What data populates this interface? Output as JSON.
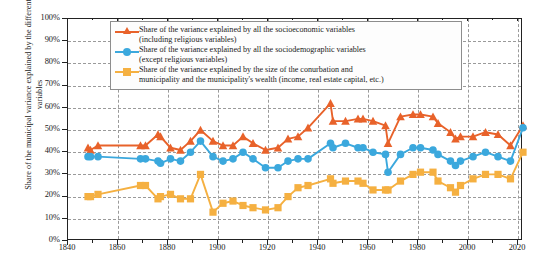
{
  "axes": {
    "ylabel": "Share of the municipal variance explained by the different variables",
    "xlabel": "",
    "yticks": [
      "0%",
      "10%",
      "20%",
      "30%",
      "40%",
      "50%",
      "60%",
      "70%",
      "80%",
      "90%",
      "100%"
    ],
    "xticks": [
      "1840",
      "1860",
      "1880",
      "1900",
      "1920",
      "1940",
      "1960",
      "1980",
      "2000",
      "2020"
    ]
  },
  "legend": {
    "items": [
      {
        "marker": "triangle-marker",
        "color": "#e8622a",
        "line1": "Share of the variance explained by all the socioeconomic variables",
        "line2": "(including religious variables)"
      },
      {
        "marker": "circle-marker",
        "color": "#3ba8dd",
        "line1": "Share of the variance explained by all the sociodemographic variables",
        "line2": "(except religious variables)"
      },
      {
        "marker": "square-marker",
        "color": "#f5b041",
        "line1": "Share of the variance explained by the size of the conurbation and",
        "line2": "municipality and the municipality's wealth (income, real estate capital, etc.)"
      }
    ]
  },
  "chart_data": {
    "type": "line",
    "title": "",
    "xlabel": "",
    "ylabel": "Share of the municipal variance explained by the different variables",
    "xlim": [
      1840,
      2022
    ],
    "ylim": [
      0,
      1
    ],
    "ytick_values": [
      0,
      0.1,
      0.2,
      0.3,
      0.4,
      0.5,
      0.6,
      0.7,
      0.8,
      0.9,
      1.0
    ],
    "ytick_labels": [
      "0%",
      "10%",
      "20%",
      "30%",
      "40%",
      "50%",
      "60%",
      "70%",
      "80%",
      "90%",
      "100%"
    ],
    "xtick_values": [
      1840,
      1860,
      1880,
      1900,
      1920,
      1940,
      1960,
      1980,
      2000,
      2020
    ],
    "grid": true,
    "legend_position": "upper-center",
    "series": [
      {
        "name": "Share of the variance explained by all the socioeconomic variables (including religious variables)",
        "color": "#e8622a",
        "marker": "triangle",
        "points": [
          [
            1848,
            0.42
          ],
          [
            1849,
            0.41
          ],
          [
            1852,
            0.43
          ],
          [
            1869,
            0.43
          ],
          [
            1871,
            0.43
          ],
          [
            1876,
            0.48
          ],
          [
            1877,
            0.47
          ],
          [
            1881,
            0.42
          ],
          [
            1885,
            0.41
          ],
          [
            1889,
            0.45
          ],
          [
            1893,
            0.5
          ],
          [
            1898,
            0.45
          ],
          [
            1902,
            0.43
          ],
          [
            1906,
            0.43
          ],
          [
            1910,
            0.47
          ],
          [
            1914,
            0.44
          ],
          [
            1919,
            0.41
          ],
          [
            1924,
            0.42
          ],
          [
            1928,
            0.46
          ],
          [
            1932,
            0.47
          ],
          [
            1936,
            0.51
          ],
          [
            1945,
            0.62
          ],
          [
            1946,
            0.54
          ],
          [
            1951,
            0.54
          ],
          [
            1956,
            0.55
          ],
          [
            1958,
            0.55
          ],
          [
            1962,
            0.54
          ],
          [
            1967,
            0.52
          ],
          [
            1968,
            0.44
          ],
          [
            1973,
            0.56
          ],
          [
            1978,
            0.57
          ],
          [
            1981,
            0.57
          ],
          [
            1986,
            0.56
          ],
          [
            1988,
            0.53
          ],
          [
            1993,
            0.49
          ],
          [
            1995,
            0.46
          ],
          [
            1997,
            0.47
          ],
          [
            2002,
            0.47
          ],
          [
            2007,
            0.49
          ],
          [
            2012,
            0.48
          ],
          [
            2017,
            0.43
          ],
          [
            2022,
            0.52
          ]
        ]
      },
      {
        "name": "Share of the variance explained by all the sociodemographic variables (except religious variables)",
        "color": "#3ba8dd",
        "marker": "circle",
        "points": [
          [
            1848,
            0.38
          ],
          [
            1849,
            0.38
          ],
          [
            1852,
            0.38
          ],
          [
            1869,
            0.37
          ],
          [
            1871,
            0.37
          ],
          [
            1876,
            0.36
          ],
          [
            1877,
            0.35
          ],
          [
            1881,
            0.37
          ],
          [
            1885,
            0.36
          ],
          [
            1889,
            0.4
          ],
          [
            1893,
            0.45
          ],
          [
            1898,
            0.38
          ],
          [
            1902,
            0.36
          ],
          [
            1906,
            0.37
          ],
          [
            1910,
            0.4
          ],
          [
            1914,
            0.37
          ],
          [
            1919,
            0.33
          ],
          [
            1924,
            0.33
          ],
          [
            1928,
            0.36
          ],
          [
            1932,
            0.37
          ],
          [
            1936,
            0.37
          ],
          [
            1945,
            0.44
          ],
          [
            1946,
            0.42
          ],
          [
            1951,
            0.44
          ],
          [
            1956,
            0.42
          ],
          [
            1958,
            0.42
          ],
          [
            1962,
            0.4
          ],
          [
            1967,
            0.39
          ],
          [
            1968,
            0.31
          ],
          [
            1973,
            0.39
          ],
          [
            1978,
            0.42
          ],
          [
            1981,
            0.42
          ],
          [
            1986,
            0.41
          ],
          [
            1988,
            0.39
          ],
          [
            1993,
            0.36
          ],
          [
            1995,
            0.34
          ],
          [
            1997,
            0.36
          ],
          [
            2002,
            0.38
          ],
          [
            2007,
            0.4
          ],
          [
            2012,
            0.38
          ],
          [
            2017,
            0.36
          ],
          [
            2022,
            0.51
          ]
        ]
      },
      {
        "name": "Share of the variance explained by the size of the conurbation and municipality and the municipality's wealth (income, real estate capital, etc.)",
        "color": "#f5b041",
        "marker": "square",
        "points": [
          [
            1848,
            0.2
          ],
          [
            1849,
            0.2
          ],
          [
            1852,
            0.21
          ],
          [
            1869,
            0.25
          ],
          [
            1871,
            0.25
          ],
          [
            1876,
            0.19
          ],
          [
            1877,
            0.2
          ],
          [
            1881,
            0.21
          ],
          [
            1885,
            0.19
          ],
          [
            1889,
            0.19
          ],
          [
            1893,
            0.3
          ],
          [
            1898,
            0.13
          ],
          [
            1902,
            0.17
          ],
          [
            1906,
            0.18
          ],
          [
            1910,
            0.16
          ],
          [
            1914,
            0.15
          ],
          [
            1919,
            0.14
          ],
          [
            1924,
            0.15
          ],
          [
            1928,
            0.2
          ],
          [
            1932,
            0.24
          ],
          [
            1936,
            0.25
          ],
          [
            1945,
            0.28
          ],
          [
            1946,
            0.26
          ],
          [
            1951,
            0.27
          ],
          [
            1956,
            0.27
          ],
          [
            1958,
            0.26
          ],
          [
            1962,
            0.23
          ],
          [
            1967,
            0.23
          ],
          [
            1968,
            0.23
          ],
          [
            1973,
            0.27
          ],
          [
            1978,
            0.3
          ],
          [
            1981,
            0.31
          ],
          [
            1986,
            0.31
          ],
          [
            1988,
            0.27
          ],
          [
            1993,
            0.24
          ],
          [
            1995,
            0.22
          ],
          [
            1997,
            0.25
          ],
          [
            2002,
            0.28
          ],
          [
            2007,
            0.3
          ],
          [
            2012,
            0.3
          ],
          [
            2017,
            0.28
          ],
          [
            2022,
            0.4
          ]
        ]
      }
    ]
  }
}
